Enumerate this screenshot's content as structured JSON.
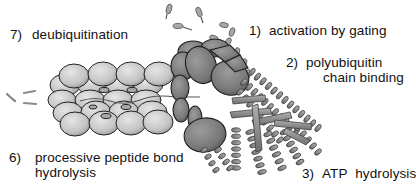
{
  "figure": {
    "colors": {
      "core_particle": "#c8c8c8",
      "regulatory_particle": "#7a7a7a",
      "atpase_helices": "#8e8e8e",
      "outline": "#222222",
      "text": "#111111"
    }
  },
  "labels": [
    {
      "id": "step-7",
      "number": "7)",
      "lines": [
        "deubiquitination"
      ]
    },
    {
      "id": "step-1",
      "number": "1)",
      "lines": [
        "activation by gating"
      ]
    },
    {
      "id": "step-2",
      "number": "2)",
      "lines": [
        "polyubiquitin",
        "chain binding"
      ]
    },
    {
      "id": "step-6",
      "number": "6)",
      "lines": [
        "processive peptide bond",
        "hydrolysis"
      ]
    },
    {
      "id": "step-3",
      "number": "3)",
      "lines": [
        "ATP",
        "hydrolysis"
      ]
    }
  ]
}
